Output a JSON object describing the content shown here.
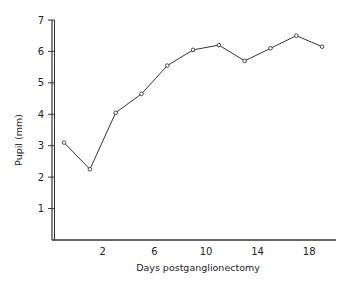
{
  "chart_data": {
    "type": "line",
    "title": "",
    "xlabel": "Days postganglionectomy",
    "ylabel": "Pupil (mm)",
    "x": [
      -1,
      1,
      3,
      5,
      7,
      9,
      11,
      13,
      15,
      17,
      19
    ],
    "series": [
      {
        "name": "Pupil diameter",
        "values": [
          3.1,
          2.25,
          4.05,
          4.65,
          5.55,
          6.05,
          6.2,
          5.7,
          6.1,
          6.5,
          6.15
        ],
        "marker": "open-circle",
        "color": "#333333"
      }
    ],
    "xticks": [
      2,
      6,
      10,
      14,
      18
    ],
    "xtick_labels": [
      "2",
      "6",
      "10",
      "14",
      "18"
    ],
    "yticks": [
      1,
      2,
      3,
      4,
      5,
      6,
      7
    ],
    "ytick_labels": [
      "1",
      "2",
      "3",
      "4",
      "5",
      "6",
      "7"
    ],
    "xlim": [
      -3,
      20
    ],
    "ylim": [
      0,
      7
    ],
    "grid": false,
    "legend": null
  }
}
